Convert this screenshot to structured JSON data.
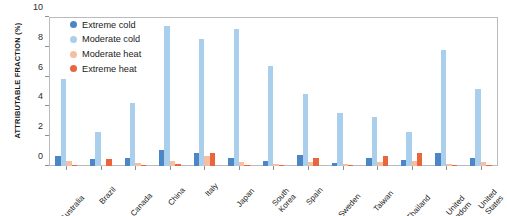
{
  "chart_data": {
    "type": "bar",
    "title": "",
    "xlabel": "",
    "ylabel": "ATTRIBUTABLE FRACTION (%)",
    "ylim": [
      0,
      10
    ],
    "yticks": [
      0,
      2,
      4,
      6,
      8,
      10
    ],
    "grid": false,
    "legend_position": "top-left-inside",
    "categories": [
      "Australia",
      "Brazil",
      "Canada",
      "China",
      "Italy",
      "Japan",
      "South Korea",
      "Spain",
      "Sweden",
      "Taiwan",
      "Thailand",
      "United Kingdom",
      "United States"
    ],
    "series": [
      {
        "name": "Extreme cold",
        "color": "#4c86c6",
        "values": [
          0.65,
          0.45,
          0.55,
          1.1,
          0.85,
          0.55,
          0.35,
          0.75,
          0.2,
          0.55,
          0.4,
          0.9,
          0.55
        ]
      },
      {
        "name": "Moderate cold",
        "color": "#a9cfec",
        "values": [
          5.85,
          2.3,
          4.25,
          9.4,
          8.55,
          9.2,
          6.7,
          4.8,
          3.55,
          3.3,
          2.25,
          7.8,
          5.15
        ]
      },
      {
        "name": "Moderate heat",
        "color": "#f6bfa2",
        "values": [
          0.35,
          0.1,
          0.2,
          0.35,
          0.65,
          0.25,
          0.15,
          0.3,
          0.15,
          0.25,
          0.35,
          0.15,
          0.25
        ]
      },
      {
        "name": "Extreme heat",
        "color": "#e8653d",
        "values": [
          0.1,
          0.5,
          0.05,
          0.15,
          0.85,
          0.1,
          0.05,
          0.55,
          0.05,
          0.7,
          0.9,
          0.05,
          0.05
        ]
      }
    ]
  },
  "legend": {
    "items": [
      {
        "label": "Extreme cold",
        "color": "#4c86c6"
      },
      {
        "label": "Moderate cold",
        "color": "#a9cfec"
      },
      {
        "label": "Moderate heat",
        "color": "#f6bfa2"
      },
      {
        "label": "Extreme heat",
        "color": "#e8653d"
      }
    ]
  }
}
